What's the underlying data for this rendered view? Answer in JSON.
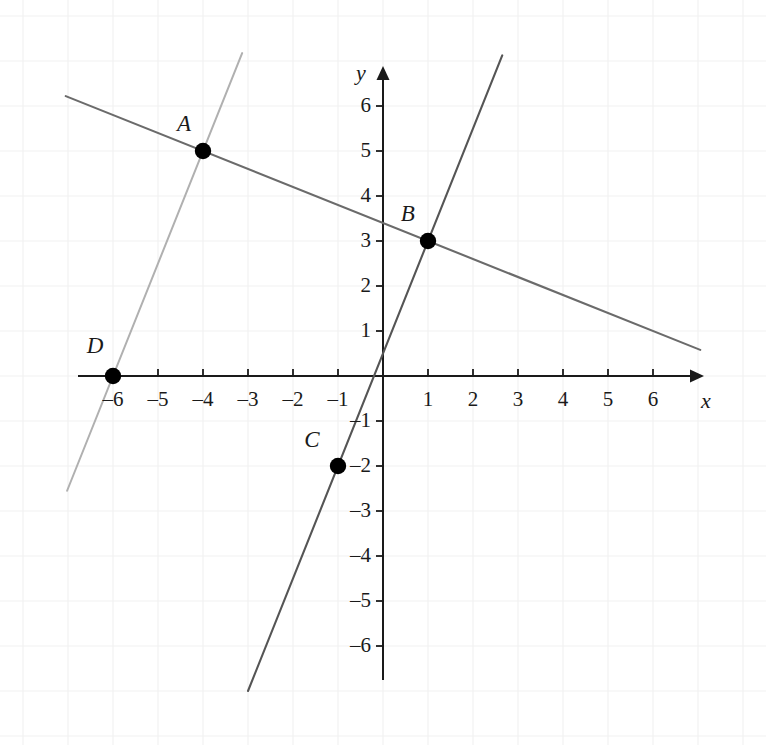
{
  "figure": {
    "width": 766,
    "height": 745,
    "background_color": "#ffffff",
    "grid_color": "#f2f2f2",
    "axis_color": "#1a1a1a"
  },
  "chart_data": {
    "type": "scatter",
    "title": "",
    "xlabel": "x",
    "ylabel": "y",
    "xlim": [
      -6.9,
      6.9
    ],
    "ylim": [
      -6.8,
      6.6
    ],
    "grid": true,
    "grid_style": "faint square grid, 1 unit spacing",
    "legend": "none",
    "x_ticks": [
      -6,
      -5,
      -4,
      -3,
      -2,
      -1,
      1,
      2,
      3,
      4,
      5,
      6
    ],
    "y_ticks": [
      -6,
      -5,
      -4,
      -3,
      -2,
      -1,
      1,
      2,
      3,
      4,
      5,
      6
    ],
    "x_tick_labels": [
      "–6",
      "–5",
      "–4",
      "–3",
      "–2",
      "–1",
      "1",
      "2",
      "3",
      "4",
      "5",
      "6"
    ],
    "y_tick_labels": [
      "–6",
      "–5",
      "–4",
      "–3",
      "–2",
      "–1",
      "1",
      "2",
      "3",
      "4",
      "5",
      "6"
    ],
    "origin_label": "",
    "points": [
      {
        "label": "A",
        "x": -4,
        "y": 5,
        "label_dx": -0.42,
        "label_dy": 0.62,
        "color": "#000000"
      },
      {
        "label": "B",
        "x": 1,
        "y": 3,
        "label_dx": -0.45,
        "label_dy": 0.62,
        "color": "#000000"
      },
      {
        "label": "C",
        "x": -1,
        "y": -2,
        "label_dx": -0.58,
        "label_dy": 0.6,
        "color": "#000000"
      },
      {
        "label": "D",
        "x": -6,
        "y": 0,
        "label_dx": -0.4,
        "label_dy": 0.7,
        "color": "#000000"
      }
    ],
    "lines": [
      {
        "name": "line-AB",
        "through": [
          "A",
          "B"
        ],
        "slope": -0.4,
        "intercept": 3.4,
        "x_start": -7.05,
        "x_end": 7.05,
        "color": "#6b6b6b",
        "width": 2.1
      },
      {
        "name": "line-DA",
        "through": [
          "D",
          "A"
        ],
        "slope": 2.5,
        "intercept": 15,
        "x_start": -7.02,
        "x_end": -3.13,
        "color": "#b0b0b0",
        "width": 2.0
      },
      {
        "name": "line-CB",
        "through": [
          "C",
          "B"
        ],
        "slope": 2.5,
        "intercept": 0.5,
        "x_start": -3.0,
        "x_end": 2.65,
        "color": "#555555",
        "width": 2.1
      }
    ],
    "annotations": []
  },
  "axes": {
    "x_axis_name": "x-axis",
    "y_axis_name": "y-axis",
    "x_axis_label": "x",
    "y_axis_label": "y",
    "arrowheads": [
      "x-positive",
      "y-positive"
    ]
  }
}
